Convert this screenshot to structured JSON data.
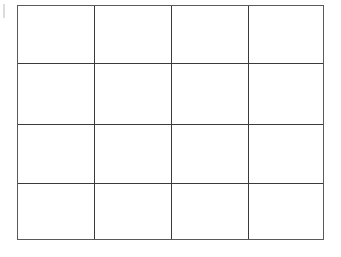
{
  "grid": {
    "rows": 4,
    "columns": 4,
    "line_color": "#3a3a3a",
    "border_color": "#5a5a5a",
    "background": "#ffffff",
    "cells": [
      [
        "",
        "",
        "",
        ""
      ],
      [
        "",
        "",
        "",
        ""
      ],
      [
        "",
        "",
        "",
        ""
      ],
      [
        "",
        "",
        "",
        ""
      ]
    ]
  }
}
